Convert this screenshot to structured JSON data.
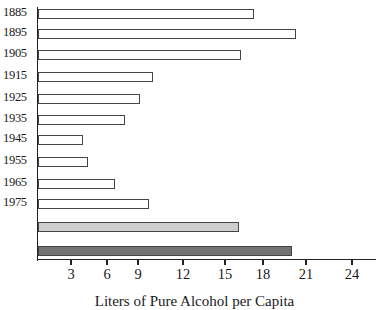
{
  "chart_data": {
    "type": "bar",
    "orientation": "horizontal",
    "title": "",
    "xlabel": "Liters of Pure Alcohol per Capita",
    "ylabel": "",
    "categories": [
      "1885",
      "1895",
      "1905",
      "1915",
      "1925",
      "1935",
      "1945",
      "1955",
      "1965",
      "1975",
      "",
      ""
    ],
    "values": [
      17.3,
      20.3,
      16.3,
      10.0,
      9.1,
      7.7,
      4.0,
      4.4,
      6.8,
      9.7,
      16.1,
      20.0
    ],
    "bar_styles": [
      "plain",
      "plain",
      "plain",
      "plain",
      "plain",
      "plain",
      "plain",
      "plain",
      "plain",
      "plain",
      "light-stipple",
      "dark-stipple"
    ],
    "xticks": [
      3,
      6,
      9,
      12,
      15,
      18,
      21,
      24
    ],
    "xtick_labels": [
      "3",
      "6",
      "9",
      "12",
      "15",
      "18",
      "21",
      "24"
    ],
    "xlim": [
      0,
      26
    ],
    "grid": false,
    "legend": null
  },
  "axis": {
    "x_title": "Liters of Pure Alcohol per Capita"
  }
}
